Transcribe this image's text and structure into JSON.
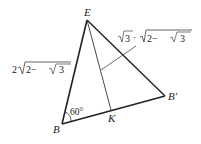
{
  "diagram": {
    "vertices": {
      "E": "E",
      "B": "B",
      "B_prime": "B′",
      "K": "K"
    },
    "angle_label": "60°",
    "side_EB_label": {
      "coef": "2",
      "inner_left": "2−",
      "inner_root": "3"
    },
    "segment_label": {
      "root1": "3",
      "dot": "·",
      "inner_left": "2−",
      "inner_root": "3"
    }
  }
}
